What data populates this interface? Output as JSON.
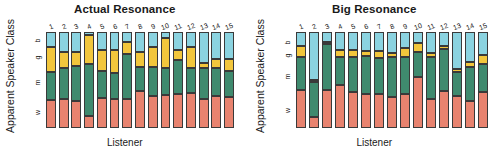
{
  "figure": {
    "xlabel": "Listener",
    "ylabel": "Apparent Speaker Class"
  },
  "chart_data": {
    "type": "bar",
    "subtitle": "",
    "xlabel": "Listener",
    "ylabel": "Apparent Speaker Class",
    "ylim": [
      0,
      1
    ],
    "grid": false,
    "legend_position": "none",
    "categories": [
      "1",
      "2",
      "3",
      "4",
      "5",
      "6",
      "7",
      "8",
      "9",
      "10",
      "11",
      "12",
      "13",
      "14",
      "15"
    ],
    "class_labels_bottom_to_top": [
      "w",
      "m",
      "g",
      "b"
    ],
    "class_labels_top_to_bottom": [
      "b",
      "g",
      "m",
      "w"
    ],
    "colors": {
      "b": "#8bd3e0",
      "g": "#f2c63c",
      "m": "#3f8a6e",
      "w": "#e8836f",
      "outline": "#3a3a3a",
      "text": "#1a1a1a",
      "background": "#ffffff"
    },
    "panels": [
      {
        "title": "Actual Resonance",
        "series": [
          {
            "name": "b",
            "values": [
              0.16,
              0.21,
              0.21,
              0.03,
              0.19,
              0.19,
              0.1,
              0.21,
              0.16,
              0.06,
              0.19,
              0.16,
              0.32,
              0.28,
              0.28
            ]
          },
          {
            "name": "g",
            "values": [
              0.26,
              0.17,
              0.14,
              0.3,
              0.22,
              0.24,
              0.13,
              0.15,
              0.2,
              0.32,
              0.1,
              0.22,
              0.06,
              0.1,
              0.13
            ]
          },
          {
            "name": "m",
            "values": [
              0.29,
              0.32,
              0.37,
              0.55,
              0.28,
              0.27,
              0.47,
              0.25,
              0.31,
              0.28,
              0.36,
              0.26,
              0.32,
              0.29,
              0.27
            ]
          },
          {
            "name": "w",
            "values": [
              0.29,
              0.3,
              0.28,
              0.12,
              0.31,
              0.3,
              0.3,
              0.39,
              0.33,
              0.34,
              0.35,
              0.36,
              0.3,
              0.33,
              0.32
            ]
          }
        ]
      },
      {
        "title": "Big Resonance",
        "series": [
          {
            "name": "b",
            "values": [
              0.15,
              0.5,
              0.1,
              0.19,
              0.19,
              0.2,
              0.2,
              0.22,
              0.17,
              0.11,
              0.22,
              0.15,
              0.39,
              0.31,
              0.24
            ]
          },
          {
            "name": "g",
            "values": [
              0.11,
              0.02,
              0.03,
              0.07,
              0.07,
              0.05,
              0.07,
              0.04,
              0.09,
              0.1,
              0.04,
              0.03,
              0.03,
              0.05,
              0.09
            ]
          },
          {
            "name": "m",
            "values": [
              0.34,
              0.37,
              0.47,
              0.29,
              0.36,
              0.4,
              0.38,
              0.42,
              0.39,
              0.26,
              0.44,
              0.43,
              0.25,
              0.36,
              0.3
            ]
          },
          {
            "name": "w",
            "values": [
              0.4,
              0.11,
              0.4,
              0.45,
              0.38,
              0.35,
              0.35,
              0.32,
              0.35,
              0.53,
              0.3,
              0.39,
              0.33,
              0.28,
              0.37
            ]
          }
        ]
      }
    ]
  }
}
